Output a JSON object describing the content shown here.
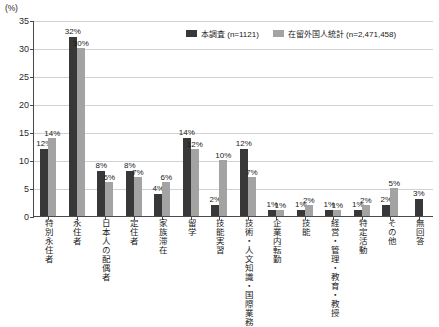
{
  "chart_data": {
    "type": "bar",
    "title": "",
    "xlabel": "",
    "ylabel": "(%)",
    "ylim": [
      0,
      35
    ],
    "yticks": [
      0,
      5,
      10,
      15,
      20,
      25,
      30,
      35
    ],
    "grid": true,
    "legend_position": "top-center",
    "categories": [
      "特別永住者",
      "永住者",
      "日本人の配偶者",
      "定住者",
      "家族滞在",
      "留学",
      "技能実習",
      "技術・人文知識・国際業務",
      "企業内転勤",
      "技能",
      "経営・管理・教育・教授",
      "特定活動",
      "その他",
      "無回答"
    ],
    "series": [
      {
        "name": "本調査 (n=1121)",
        "color": "#383838",
        "values": [
          12,
          32,
          8,
          8,
          4,
          14,
          2,
          12,
          1,
          1,
          1,
          1,
          2,
          3
        ],
        "labels": [
          "12%",
          "32%",
          "8%",
          "8%",
          "4%",
          "14%",
          "2%",
          "12%",
          "1%",
          "1%",
          "1%",
          "1%",
          "2%",
          "3%"
        ]
      },
      {
        "name": "在留外国人統計 (n=2,471,458)",
        "color": "#a3a3a3",
        "values": [
          14,
          30,
          6,
          7,
          6,
          12,
          10,
          7,
          1,
          2,
          1,
          2,
          5,
          null
        ],
        "labels": [
          "14%",
          "30%",
          "6%",
          "7%",
          "6%",
          "12%",
          "10%",
          "7%",
          "1%",
          "2%",
          "1%",
          "2%",
          "5%",
          ""
        ]
      }
    ]
  },
  "legend": {
    "items": [
      {
        "label": "本調査 (n=1121)",
        "swatch": "dark"
      },
      {
        "label": "在留外国人統計 (n=2,471,458)",
        "swatch": "light"
      }
    ]
  },
  "axis": {
    "unit": "(%)"
  }
}
